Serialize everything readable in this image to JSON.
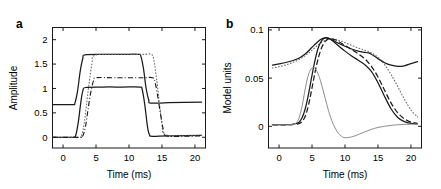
{
  "figure": {
    "panels": [
      {
        "label": "a",
        "xlabel": "Time (ms)",
        "ylabel": "Amplitude",
        "xticks": [
          "0",
          "5",
          "10",
          "15",
          "20"
        ],
        "yticks": [
          "0",
          "0.5",
          "1",
          "1.5",
          "2"
        ],
        "xlim": [
          -1.6,
          21.6
        ],
        "ylim": [
          -0.22,
          2.25
        ]
      },
      {
        "label": "b",
        "xlabel": "Time (ms)",
        "ylabel": "Model units",
        "xticks": [
          "0",
          "5",
          "10",
          "15",
          "20"
        ],
        "yticks": [
          "0",
          "0.05",
          "0.1"
        ],
        "xlim": [
          -1.6,
          21.6
        ],
        "ylim": [
          -0.0225,
          0.1025
        ]
      }
    ]
  },
  "chart_data": [
    {
      "type": "line",
      "title": "",
      "panel": "a",
      "xlabel": "Time (ms)",
      "ylabel": "Amplitude",
      "xlim": [
        -1.6,
        21.6
      ],
      "ylim": [
        -0.22,
        2.25
      ],
      "xticks": [
        0,
        5,
        10,
        15,
        20
      ],
      "yticks": [
        0,
        0.5,
        1,
        1.5,
        2
      ],
      "grid": false,
      "legend": "none",
      "series": [
        {
          "name": "upper step (solid)",
          "style": "solid",
          "color": "#1a1a1a",
          "x": [
            -1.6,
            1.4,
            1.8,
            2.2,
            2.6,
            3.0,
            3.3,
            6.0,
            9.0,
            11.4,
            11.8,
            12.2,
            12.6,
            13.0,
            13.3,
            16.0,
            21.0
          ],
          "y": [
            0.67,
            0.67,
            0.7,
            0.95,
            1.35,
            1.62,
            1.69,
            1.7,
            1.7,
            1.7,
            1.66,
            1.4,
            1.0,
            0.76,
            0.7,
            0.71,
            0.72
          ]
        },
        {
          "name": "lower step (solid)",
          "style": "solid",
          "color": "#1a1a1a",
          "x": [
            -1.6,
            1.5,
            1.9,
            2.3,
            2.7,
            3.0,
            3.4,
            6.0,
            9.0,
            11.6,
            12.0,
            12.4,
            12.8,
            13.1,
            13.5,
            16.0,
            21.0
          ],
          "y": [
            0.0,
            0.0,
            0.03,
            0.3,
            0.72,
            0.95,
            1.02,
            1.03,
            1.03,
            1.03,
            0.98,
            0.66,
            0.22,
            0.05,
            0.02,
            0.03,
            0.04
          ]
        },
        {
          "name": "delayed step (dotted)",
          "style": "dotted",
          "color": "#6e6e6e",
          "x": [
            -1.6,
            2.4,
            2.8,
            3.2,
            3.6,
            4.0,
            4.4,
            4.8,
            8.0,
            12.0,
            13.4,
            13.8,
            14.2,
            14.6,
            15.0,
            15.4,
            18.0,
            21.0
          ],
          "y": [
            0.0,
            0.0,
            0.04,
            0.28,
            0.72,
            1.16,
            1.52,
            1.68,
            1.7,
            1.7,
            1.7,
            1.56,
            1.18,
            0.72,
            0.28,
            0.06,
            0.03,
            0.04
          ]
        },
        {
          "name": "delayed step (dash-dot)",
          "style": "dashdot",
          "color": "#1a1a1a",
          "x": [
            -1.6,
            2.6,
            3.0,
            3.4,
            3.8,
            4.2,
            4.6,
            5.0,
            8.0,
            12.0,
            13.6,
            14.0,
            14.4,
            14.8,
            15.2,
            15.6,
            18.0,
            21.0
          ],
          "y": [
            0.0,
            0.0,
            0.03,
            0.22,
            0.58,
            0.92,
            1.15,
            1.22,
            1.22,
            1.22,
            1.22,
            1.1,
            0.8,
            0.46,
            0.16,
            0.03,
            0.02,
            0.03
          ]
        }
      ]
    },
    {
      "type": "line",
      "title": "",
      "panel": "b",
      "xlabel": "Time (ms)",
      "ylabel": "Model units",
      "xlim": [
        -1.6,
        21.6
      ],
      "ylim": [
        -0.0225,
        0.1025
      ],
      "xticks": [
        0,
        5,
        10,
        15,
        20
      ],
      "yticks": [
        0,
        0.05,
        0.1
      ],
      "grid": false,
      "legend": "none",
      "series": [
        {
          "name": "broad response (solid)",
          "style": "solid",
          "color": "#1a1a1a",
          "x": [
            -1.0,
            0,
            1,
            2,
            3,
            4,
            5,
            6,
            6.5,
            7,
            7.5,
            8,
            9,
            10,
            11,
            12,
            13,
            13.5,
            14,
            15,
            16,
            17,
            18,
            19,
            20,
            21
          ],
          "y": [
            0.0635,
            0.0648,
            0.0662,
            0.068,
            0.0706,
            0.0752,
            0.082,
            0.0886,
            0.0908,
            0.0918,
            0.0912,
            0.0898,
            0.0862,
            0.083,
            0.0802,
            0.078,
            0.0768,
            0.0762,
            0.0748,
            0.0702,
            0.066,
            0.0634,
            0.0622,
            0.0628,
            0.065,
            0.0672
          ]
        },
        {
          "name": "broad response shifted (dotted)",
          "style": "dotted",
          "color": "#6e6e6e",
          "x": [
            -1.0,
            0,
            1,
            2,
            3,
            4,
            5,
            6,
            7,
            7.5,
            8,
            8.5,
            9,
            10,
            11,
            12,
            13,
            14,
            15,
            16,
            17,
            18,
            19,
            20,
            21
          ],
          "y": [
            0.0605,
            0.0618,
            0.0636,
            0.066,
            0.0692,
            0.0736,
            0.079,
            0.0848,
            0.0892,
            0.0902,
            0.0904,
            0.09,
            0.0892,
            0.0868,
            0.084,
            0.0812,
            0.079,
            0.0762,
            0.0716,
            0.064,
            0.0536,
            0.0412,
            0.0282,
            0.017,
            0.0096
          ]
        },
        {
          "name": "narrow response (solid)",
          "style": "solid",
          "color": "#1a1a1a",
          "x": [
            -1.0,
            0,
            1,
            2,
            3,
            3.5,
            4,
            4.5,
            5,
            5.5,
            6,
            6.5,
            7,
            7.5,
            8,
            9,
            10,
            11,
            12,
            13,
            14,
            15,
            16,
            17,
            18,
            19,
            20,
            21
          ],
          "y": [
            0.0018,
            0.0018,
            0.0018,
            0.002,
            0.004,
            0.009,
            0.019,
            0.0345,
            0.053,
            0.07,
            0.0826,
            0.0892,
            0.0918,
            0.0914,
            0.0892,
            0.0836,
            0.078,
            0.073,
            0.0686,
            0.064,
            0.057,
            0.0452,
            0.031,
            0.018,
            0.0092,
            0.0048,
            0.003,
            0.0026
          ]
        },
        {
          "name": "delayed narrow (dashed)",
          "style": "dashed",
          "color": "#1a1a1a",
          "x": [
            -1.0,
            0,
            1,
            2,
            3,
            3.5,
            4,
            4.5,
            5,
            5.5,
            6,
            6.5,
            7,
            7.5,
            8,
            8.5,
            9,
            10,
            11,
            12,
            13,
            14,
            15,
            16,
            17,
            18,
            19,
            20,
            21
          ],
          "y": [
            0.0016,
            0.0016,
            0.0016,
            0.0018,
            0.0028,
            0.005,
            0.011,
            0.023,
            0.04,
            0.0575,
            0.072,
            0.0822,
            0.088,
            0.0906,
            0.0908,
            0.0898,
            0.088,
            0.0838,
            0.0796,
            0.0752,
            0.07,
            0.0622,
            0.0512,
            0.0374,
            0.024,
            0.014,
            0.0078,
            0.0044,
            0.003
          ]
        },
        {
          "name": "transient (thin gray)",
          "style": "solid-thin",
          "color": "#8c8c8c",
          "x": [
            -1.0,
            0,
            1,
            2,
            2.5,
            3,
            3.5,
            4,
            4.5,
            5,
            5.5,
            6,
            6.5,
            7,
            7.5,
            8,
            8.5,
            9,
            9.5,
            10,
            11,
            12,
            13,
            14,
            15,
            16,
            17,
            18,
            19,
            20,
            21
          ],
          "y": [
            0.0016,
            0.0016,
            0.0016,
            0.0018,
            0.003,
            0.008,
            0.021,
            0.04,
            0.0545,
            0.0605,
            0.0596,
            0.053,
            0.042,
            0.029,
            0.0162,
            0.0058,
            -0.0018,
            -0.0072,
            -0.0105,
            -0.0118,
            -0.011,
            -0.0086,
            -0.0058,
            -0.0032,
            -0.0012,
            0.0,
            0.001,
            0.0016,
            0.002,
            0.0022,
            0.0024
          ]
        }
      ]
    }
  ]
}
